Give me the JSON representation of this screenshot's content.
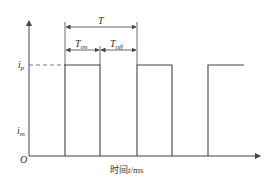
{
  "diagram": {
    "type": "square-wave-timing",
    "colors": {
      "line": "#444444",
      "text": "#333333",
      "background": "#ffffff"
    },
    "y_axis": {
      "labels": {
        "ip": {
          "main": "i",
          "sub": "p"
        },
        "im": {
          "main": "i",
          "sub": "m"
        }
      }
    },
    "origin_label": "O",
    "x_axis": {
      "label_cn": "时间",
      "label_var": "t",
      "label_unit": "/ms"
    },
    "period_label": "T",
    "on_label": {
      "main": "T",
      "sub": "on"
    },
    "off_label": {
      "main": "T",
      "sub": "off"
    },
    "pulses": [
      {
        "rise_x": 65,
        "fall_x": 100
      },
      {
        "rise_x": 137,
        "fall_x": 172
      },
      {
        "rise_x": 208,
        "fall_x": 244
      }
    ]
  }
}
